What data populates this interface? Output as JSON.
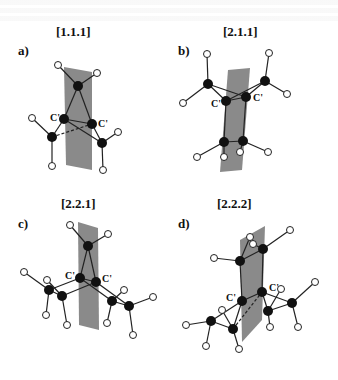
{
  "figure": {
    "panels": [
      {
        "letter": "a)",
        "title": "[1.1.1]",
        "atom_label_left": "C'",
        "atom_label_right": "C'"
      },
      {
        "letter": "b)",
        "title": "[2.1.1]",
        "atom_label_left": "C'",
        "atom_label_right": "C'"
      },
      {
        "letter": "c)",
        "title": "[2.2.1]",
        "atom_label_left": "C'",
        "atom_label_right": "C'"
      },
      {
        "letter": "d)",
        "title": "[2.2.2]",
        "atom_label_left": "C'",
        "atom_label_right": "C'"
      }
    ],
    "colors": {
      "plane": "#8a8a8a",
      "carbon": "#111111",
      "hydrogen_fill": "#ffffff",
      "bond": "#222222"
    }
  }
}
